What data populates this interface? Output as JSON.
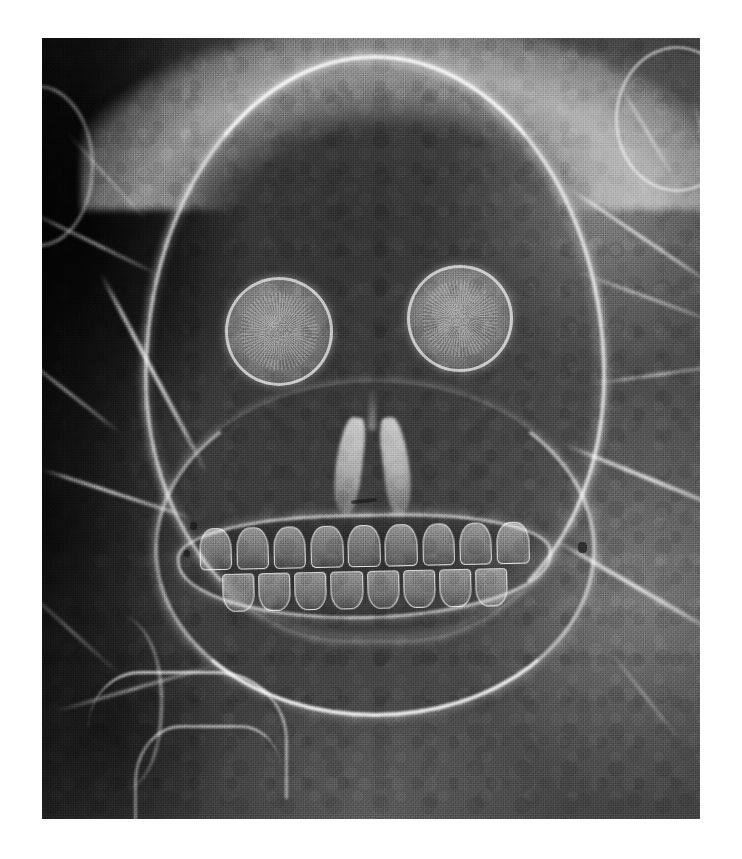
{
  "document": {
    "kind": "aerial-photograph-plate",
    "subject": "Skull geoglyph formed by light-toned cleared paths in dark terrain",
    "medium": "halftone black-and-white reproduction",
    "background_color": "#ffffff"
  },
  "photo": {
    "alt_text": "Grainy monochrome aerial photograph of a large skull-shaped geoglyph: bright cleared lines trace a rounded cranium, two circular eye sockets, a pair of nasal openings, a wide grinning row of upper and lower teeth, and a curving jaw line, set against mottled dark vegetation with radiating field paths.",
    "bounds": {
      "x": 42,
      "y": 38,
      "width": 658,
      "height": 781
    },
    "tones": {
      "deep_shadow": "#242424",
      "shadow": "#4a4a4a",
      "mid_dark": "#6e6e6e",
      "mid": "#8a8a8a",
      "mid_light": "#a2a2a2",
      "highlight": "#d8d8d8",
      "bright_line": "#f6f6f6"
    }
  },
  "features": {
    "cranium": {
      "label": "cranium-outline"
    },
    "eyes": [
      {
        "label": "left-eye-socket"
      },
      {
        "label": "right-eye-socket"
      }
    ],
    "nose": {
      "label": "nasal-aperture"
    },
    "mouth": {
      "label": "teeth-row",
      "upper_teeth_count": 9,
      "lower_teeth_count": 8
    },
    "jaw": {
      "label": "mandible-arc"
    },
    "lineaments": {
      "right_side_count": 7,
      "left_side_count": 6,
      "description": "bright radiating tracks and field boundaries"
    },
    "field_polygons": 3,
    "corner_arcs": 2,
    "specks": 4
  }
}
